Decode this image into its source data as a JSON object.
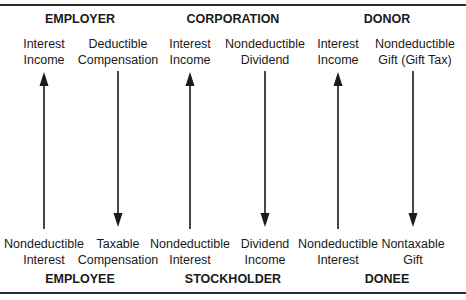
{
  "top_entities": [
    {
      "name": "EMPLOYER",
      "center_x": 80
    },
    {
      "name": "CORPORATION",
      "center_x": 233
    },
    {
      "name": "DONOR",
      "center_x": 387
    }
  ],
  "bottom_entities": [
    {
      "name": "EMPLOYEE",
      "center_x": 80
    },
    {
      "name": "STOCKHOLDER",
      "center_x": 233
    },
    {
      "name": "DONEE",
      "center_x": 387
    }
  ],
  "columns": [
    {
      "x": 44,
      "direction": "up",
      "top_label": [
        "Interest",
        "Income"
      ],
      "bottom_label": [
        "Nondeductible",
        "Interest"
      ]
    },
    {
      "x": 118,
      "direction": "down",
      "top_label": [
        "Deductible",
        "Compensation"
      ],
      "bottom_label": [
        "Taxable",
        "Compensation"
      ]
    },
    {
      "x": 190,
      "direction": "up",
      "top_label": [
        "Interest",
        "Income"
      ],
      "bottom_label": [
        "Nondeductible",
        "Interest"
      ]
    },
    {
      "x": 265,
      "direction": "down",
      "top_label": [
        "Nondeductible",
        "Dividend"
      ],
      "bottom_label": [
        "Dividend",
        "Income"
      ]
    },
    {
      "x": 338,
      "direction": "up",
      "top_label": [
        "Interest",
        "Income"
      ],
      "bottom_label": [
        "Nondeductible",
        "Interest"
      ]
    },
    {
      "x": 413,
      "direction": "down",
      "top_label": [
        "Nondeductible",
        "Gift (Gift Tax)"
      ],
      "bottom_label": [
        "Nontaxable",
        "Gift"
      ]
    }
  ]
}
